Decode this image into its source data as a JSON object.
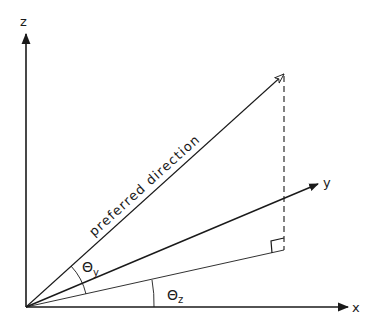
{
  "diagram": {
    "type": "3d-axes-angle-diagram",
    "colors": {
      "line": "#1a1a1a",
      "background": "#ffffff"
    },
    "axes": {
      "z": {
        "label": "z"
      },
      "x": {
        "label": "x"
      },
      "y": {
        "label": "y"
      }
    },
    "vectors": {
      "preferred_direction": {
        "label": "preferred direction"
      }
    },
    "angles": {
      "theta_y": {
        "symbol": "Θ",
        "subscript": "y"
      },
      "theta_z": {
        "symbol": "Θ",
        "subscript": "z"
      }
    },
    "annotations": {
      "projection": "dashed vertical drop to x-y plane",
      "right_angle_marker": "square at projection foot"
    }
  }
}
